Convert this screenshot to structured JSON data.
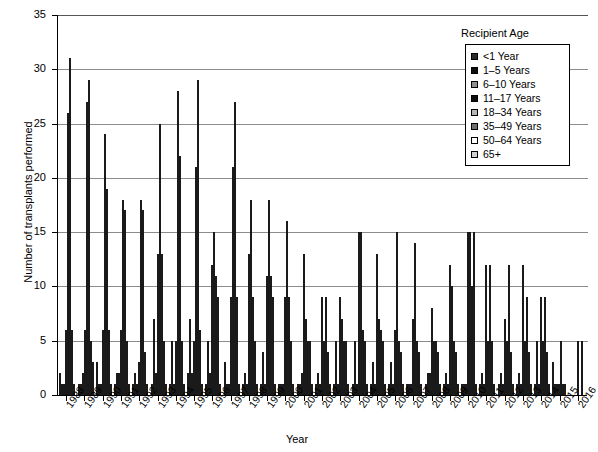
{
  "chart_data": {
    "type": "bar",
    "title": "",
    "xlabel": "Year",
    "ylabel": "Number of transplants performed",
    "ylim": [
      0,
      35
    ],
    "ytick_values": [
      0,
      5,
      10,
      15,
      20,
      25,
      30,
      35
    ],
    "ytick_labels": [
      "0",
      "5",
      "10",
      "15",
      "20",
      "25",
      "30",
      "35"
    ],
    "grid": "horizontal",
    "legend_title": "Recipient Age",
    "legend_position": "top-right",
    "categories": [
      "1988",
      "1989",
      "1990",
      "1991",
      "1992",
      "1993",
      "1994",
      "1995",
      "1996",
      "1997",
      "1998",
      "1999",
      "2000",
      "2001",
      "2002",
      "2003",
      "2004",
      "2005",
      "2006",
      "2007",
      "2008",
      "2009",
      "2010",
      "2011",
      "2012",
      "2013",
      "2014",
      "2015",
      "2016"
    ],
    "series": [
      {
        "name": "<1 Year",
        "color": "#2b2b2b",
        "values": [
          2,
          1,
          3,
          1,
          1,
          1,
          1,
          2,
          1,
          3,
          1,
          1,
          1,
          1,
          1,
          1,
          1,
          1,
          1,
          1,
          1,
          1,
          1,
          1,
          1,
          1,
          1,
          0,
          0
        ]
      },
      {
        "name": "1–5 Years",
        "color": "#0d0d0d",
        "values": [
          1,
          1,
          1,
          2,
          2,
          7,
          5,
          7,
          5,
          1,
          2,
          4,
          1,
          1,
          2,
          5,
          5,
          3,
          3,
          1,
          2,
          2,
          1,
          2,
          2,
          2,
          5,
          3,
          0
        ]
      },
      {
        "name": "6–10 Years",
        "color": "#8f8f8f",
        "values": [
          1,
          2,
          1,
          2,
          1,
          2,
          1,
          2,
          2,
          1,
          1,
          1,
          1,
          2,
          1,
          1,
          1,
          1,
          1,
          1,
          2,
          1,
          1,
          1,
          1,
          1,
          1,
          1,
          0
        ]
      },
      {
        "name": "11–17 Years",
        "color": "#0d0d0d",
        "values": [
          6,
          6,
          6,
          6,
          3,
          13,
          5,
          5,
          12,
          9,
          13,
          11,
          9,
          13,
          9,
          9,
          15,
          13,
          6,
          7,
          8,
          12,
          15,
          12,
          7,
          12,
          9,
          1,
          0
        ]
      },
      {
        "name": "18–34 Years",
        "color": "#b5b5b5",
        "values": [
          26,
          27,
          24,
          18,
          18,
          25,
          28,
          21,
          15,
          21,
          18,
          18,
          16,
          7,
          5,
          7,
          15,
          7,
          15,
          14,
          5,
          10,
          15,
          5,
          5,
          5,
          5,
          1,
          5
        ]
      },
      {
        "name": "35–49 Years",
        "color": "#6e6e6e",
        "values": [
          31,
          29,
          19,
          17,
          17,
          13,
          22,
          29,
          11,
          27,
          9,
          11,
          9,
          5,
          9,
          5,
          6,
          6,
          5,
          5,
          5,
          5,
          10,
          12,
          12,
          9,
          9,
          5,
          0
        ]
      },
      {
        "name": "50–64 Years",
        "color": "#ffffff",
        "values": [
          6,
          5,
          6,
          5,
          4,
          5,
          5,
          6,
          9,
          9,
          5,
          9,
          5,
          5,
          4,
          5,
          5,
          5,
          4,
          4,
          4,
          4,
          15,
          5,
          4,
          4,
          4,
          1,
          5
        ]
      },
      {
        "name": "65+",
        "color": "#cfcfcf",
        "values": [
          1,
          3,
          1,
          1,
          1,
          1,
          1,
          1,
          1,
          1,
          1,
          1,
          1,
          1,
          1,
          1,
          1,
          1,
          1,
          1,
          1,
          1,
          1,
          1,
          1,
          1,
          1,
          1,
          0
        ]
      }
    ]
  },
  "legend": {
    "title": "Recipient Age",
    "items": [
      {
        "label": "<1 Year",
        "color": "#2b2b2b"
      },
      {
        "label": "1–5 Years",
        "color": "#0d0d0d"
      },
      {
        "label": "6–10 Years",
        "color": "#8f8f8f"
      },
      {
        "label": "11–17 Years",
        "color": "#0d0d0d"
      },
      {
        "label": "18–34 Years",
        "color": "#b5b5b5"
      },
      {
        "label": "35–49 Years",
        "color": "#6e6e6e"
      },
      {
        "label": "50–64 Years",
        "color": "#ffffff"
      },
      {
        "label": "65+",
        "color": "#cfcfcf"
      }
    ]
  },
  "axes": {
    "x_title": "Year",
    "y_title": "Number of transplants performed"
  }
}
